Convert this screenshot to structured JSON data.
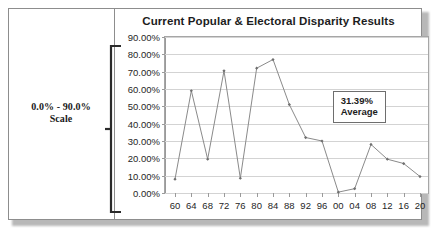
{
  "figure": {
    "left_panel": {
      "caption_line1": "0.0% - 90.0%",
      "caption_line2": "Scale"
    },
    "annotation": {
      "value": "31.39%",
      "label": "Average"
    }
  },
  "chart_data": {
    "type": "line",
    "title": "Current Popular & Electoral Disparity Results",
    "xlabel": "",
    "ylabel": "",
    "categories": [
      "60",
      "64",
      "68",
      "72",
      "76",
      "80",
      "84",
      "88",
      "92",
      "96",
      "00",
      "04",
      "08",
      "12",
      "16",
      "20"
    ],
    "values": [
      8.0,
      59.0,
      19.5,
      70.5,
      8.5,
      72.0,
      77.0,
      51.0,
      32.0,
      30.0,
      0.5,
      2.5,
      28.0,
      19.5,
      17.0,
      9.5
    ],
    "ylim": [
      0,
      90
    ],
    "ytick_values": [
      0,
      10,
      20,
      30,
      40,
      50,
      60,
      70,
      80,
      90
    ],
    "ytick_labels": [
      "0.00%",
      "10.00%",
      "20.00%",
      "30.00%",
      "40.00%",
      "50.00%",
      "60.00%",
      "70.00%",
      "80.00%",
      "90.00%"
    ],
    "grid": true,
    "legend": "none",
    "series_color": "#8a8a8a",
    "marker": "diamond",
    "annotations": [
      {
        "text": "31.39% Average",
        "x_category": "04",
        "y_value": 59
      }
    ]
  }
}
